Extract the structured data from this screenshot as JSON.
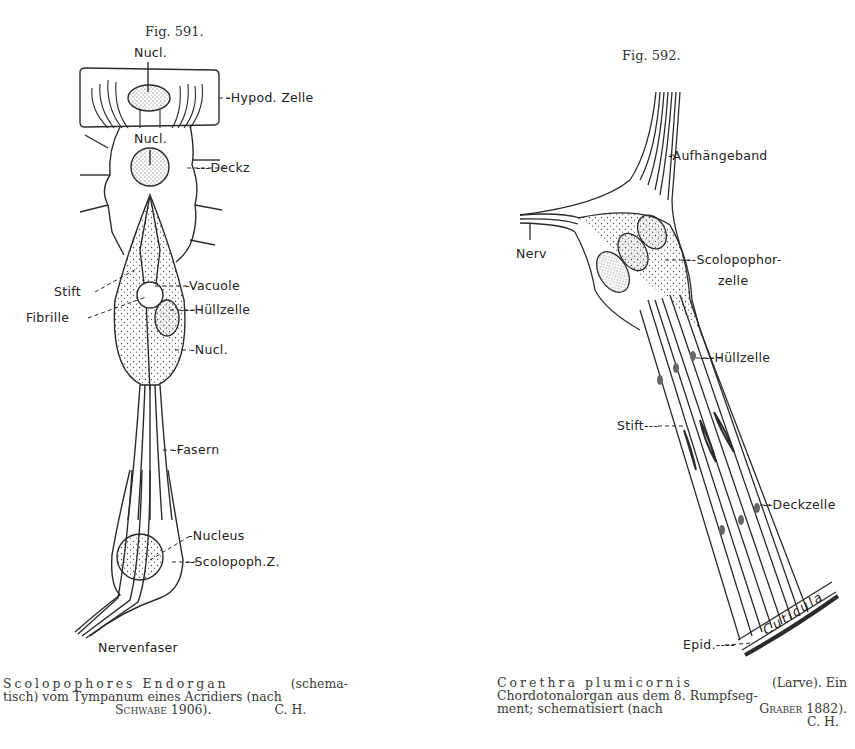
{
  "figures": [
    {
      "number": "Fig. 591.",
      "labels": {
        "nucl_top": "Nucl.",
        "hypod_zelle": "-Hypod. Zelle",
        "nucl_mid": "Nucl.",
        "deckz": "---Deckz",
        "stift": "Stift",
        "vacuole": "-Vacuole",
        "fibrille": "Fibrille",
        "huellzelle": "---Hüllzelle",
        "nucl_low": "-Nucl.",
        "fasern": "-Fasern",
        "nucleus": "-Nucleus",
        "scolopoph_z": "--Scolopoph.Z.",
        "nervenfaser": "Nervenfaser"
      },
      "caption": {
        "line1_species": "Scolopophores Endorgan",
        "line1_rest": "(schema-",
        "line2": "tisch) vom Tympanum eines Acridiers (nach",
        "line3_author": "Schwabe 1906).",
        "line3_initials": "C. H."
      }
    },
    {
      "number": "Fig. 592.",
      "labels": {
        "aufhaengeband": "-Aufhängeband",
        "nerv": "Nerv",
        "scolopophor": "---Scolopophor-",
        "zelle": "zelle",
        "huellzelle": "---Hüllzelle",
        "stift": "Stift---",
        "deckzelle": "--Deckzelle",
        "epid": "Epid.----",
        "cuticula": "Cuticula"
      },
      "caption": {
        "line1_species": "Corethra plumicornis",
        "line1_rest": "(Larve).  Ein",
        "line2": "Chordotonalorgan aus dem 8. Rumpfseg-",
        "line3": "ment; schematisiert (nach",
        "line3_author": "Graber 1882).",
        "line4_initials": "C. H."
      }
    }
  ]
}
